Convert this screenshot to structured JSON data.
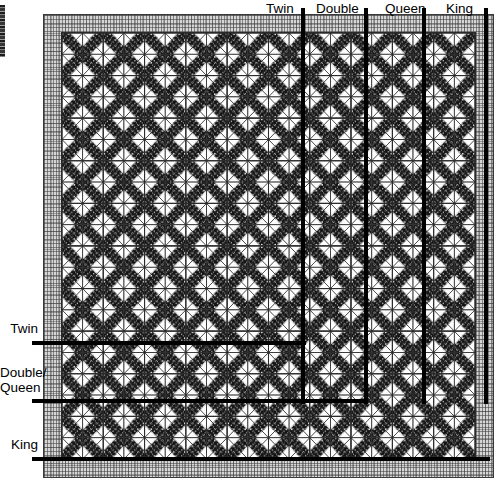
{
  "colors": {
    "rule": "#000000",
    "label_text": "#000000",
    "border_fabric": "#d6d6d6",
    "dark_fabric": "#1a1a1a",
    "light_fabric": "#ffffff",
    "medium_fabric": "#b9b9b9",
    "seam_line": "#2a2a2a",
    "page_background": "#ffffff"
  },
  "top_markers": [
    {
      "id": "twin",
      "label": "Twin",
      "x": 303,
      "label_x": 266,
      "line_top": 8,
      "line_bottom": 404
    },
    {
      "id": "double",
      "label": "Double",
      "x": 366,
      "label_x": 316,
      "line_top": 8,
      "line_bottom": 404
    },
    {
      "id": "queen",
      "label": "Queen",
      "x": 424,
      "label_x": 385,
      "line_top": 8,
      "line_bottom": 404
    },
    {
      "id": "king",
      "label": "King",
      "x": 486,
      "label_x": 446,
      "line_top": 8,
      "line_bottom": 404
    }
  ],
  "left_markers": [
    {
      "id": "twin",
      "label": "Twin",
      "label2": "",
      "y": 343,
      "label_y": 321,
      "line_left": 32,
      "line_right": 306
    },
    {
      "id": "double-queen",
      "label": "Double/",
      "label2": "Queen",
      "y": 401,
      "label_y": 365,
      "line_left": 32,
      "line_right": 368
    },
    {
      "id": "king",
      "label": "King",
      "label2": "",
      "y": 459,
      "label_y": 437,
      "line_left": 32,
      "line_right": 490
    }
  ],
  "quilt": {
    "left": 43,
    "top": 14,
    "width": 451,
    "height": 464,
    "border_width": 17,
    "block_size": 44,
    "blocks_across": 10,
    "blocks_down": 10
  },
  "edge_artifact": {
    "present": true,
    "label": "cropped-page-edge"
  }
}
